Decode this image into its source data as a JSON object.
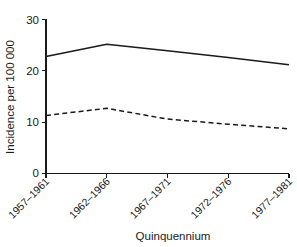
{
  "chart_data": {
    "type": "line",
    "title": "",
    "xlabel": "Quinquennium",
    "ylabel": "Incidence per 100 000",
    "categories": [
      "1957–1961",
      "1962–1966",
      "1967–1971",
      "1972–1976",
      "1977–1981"
    ],
    "series": [
      {
        "name": "solid-series",
        "style": "solid",
        "color": "#1a1a1a",
        "values": [
          22.8,
          25.2,
          23.9,
          22.6,
          21.2
        ]
      },
      {
        "name": "dashed-series",
        "style": "dashed",
        "color": "#1a1a1a",
        "values": [
          11.3,
          12.7,
          10.6,
          9.6,
          8.7
        ]
      }
    ],
    "ylim": [
      0,
      30
    ],
    "yticks": [
      0,
      10,
      20,
      30
    ],
    "ytick_labels": [
      "0",
      "10",
      "20",
      "30"
    ],
    "grid": false,
    "legend": "none",
    "xtick_label_rotation": -45
  },
  "figure": {
    "background_color": "#ffffff",
    "axis_color": "#1a1a1a"
  }
}
